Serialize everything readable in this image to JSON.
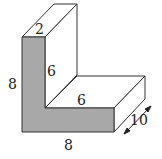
{
  "diagram": {
    "colors": {
      "front_face": "#a8a8a8",
      "line": "#333333",
      "background": "#ffffff"
    },
    "labels": {
      "top_width": "2",
      "inner_vertical": "6",
      "inner_horizontal": "6",
      "left_height": "8",
      "bottom_width": "8",
      "depth": "10"
    }
  }
}
